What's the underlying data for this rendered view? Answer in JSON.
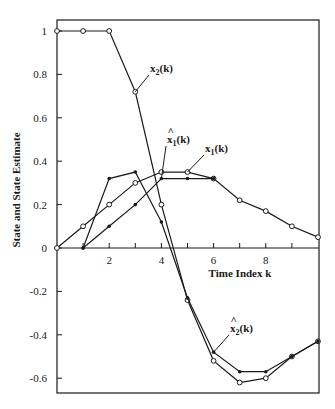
{
  "chart_data": {
    "type": "line",
    "title": "",
    "xlabel": "Time Index k",
    "ylabel": "State and State Estimate",
    "xlim": [
      0,
      10
    ],
    "ylim": [
      -0.68,
      1.07
    ],
    "x_ticks": [
      2,
      4,
      6,
      8
    ],
    "x_minor_ticks": [
      1,
      2,
      3,
      4,
      5,
      6,
      7,
      8,
      9
    ],
    "y_ticks": [
      1,
      0.8,
      0.6,
      0.4,
      0.2,
      0,
      -0.2,
      -0.4,
      -0.6
    ],
    "y_tick_labels": [
      "1",
      "0.8",
      "0.6",
      "0.4",
      "0.2",
      "0",
      "-0.2",
      "-0.4",
      "-0.6"
    ],
    "grid": false,
    "legend": "inline annotations",
    "series": [
      {
        "name": "x2(k)",
        "label_main": "x",
        "label_sub": "2",
        "label_arg": "(k)",
        "hat": false,
        "marker": "open-circle",
        "x": [
          0,
          1,
          2,
          3,
          4,
          5,
          6,
          7,
          8,
          9,
          10
        ],
        "values": [
          1,
          1,
          1,
          0.72,
          0.2,
          -0.24,
          -0.52,
          -0.62,
          -0.6,
          -0.5,
          -0.43
        ]
      },
      {
        "name": "x̂2(k)",
        "label_main": "x",
        "label_sub": "2",
        "label_arg": "(k)",
        "hat": true,
        "marker": "filled-dot",
        "x": [
          1,
          2,
          3,
          4,
          5,
          6,
          7,
          8,
          9,
          10
        ],
        "values": [
          0,
          0.32,
          0.35,
          0.12,
          -0.23,
          -0.48,
          -0.57,
          -0.57,
          -0.5,
          -0.43
        ]
      },
      {
        "name": "x1(k)",
        "label_main": "x",
        "label_sub": "1",
        "label_arg": "(k)",
        "hat": false,
        "marker": "open-circle",
        "x": [
          0,
          1,
          2,
          3,
          4,
          5,
          6,
          7,
          8,
          9,
          10
        ],
        "values": [
          0,
          0.1,
          0.2,
          0.3,
          0.35,
          0.35,
          0.32,
          0.22,
          0.17,
          0.1,
          0.05
        ]
      },
      {
        "name": "x̂1(k)",
        "label_main": "x",
        "label_sub": "1",
        "label_arg": "(k)",
        "hat": true,
        "marker": "filled-dot",
        "x": [
          1,
          2,
          3,
          4,
          5,
          6
        ],
        "values": [
          0,
          0.1,
          0.2,
          0.32,
          0.32,
          0.32
        ]
      }
    ],
    "annotations": [
      {
        "series": "x2(k)",
        "text": "x2(k)",
        "point_k": 3,
        "label_pos": [
          150,
          72
        ]
      },
      {
        "series": "x̂1(k)",
        "text": "x̂1(k)",
        "point_k": 4,
        "label_pos": [
          167,
          143
        ]
      },
      {
        "series": "x1(k)",
        "text": "x1(k)",
        "point_k": 5,
        "label_pos": [
          205,
          152
        ]
      },
      {
        "series": "x̂2(k)",
        "text": "x̂2(k)",
        "point_k": 6,
        "label_pos": [
          230,
          332
        ]
      }
    ]
  }
}
